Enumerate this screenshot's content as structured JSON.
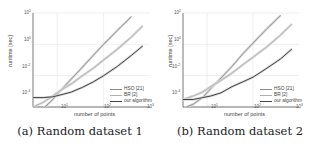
{
  "figure": {
    "panels": [
      {
        "caption": "(a) Random dataset 1",
        "xlabel": "number of points",
        "ylabel": "runtime [sec]",
        "xticks": [
          {
            "base": "10",
            "exp": "1"
          },
          {
            "base": "10",
            "exp": "2"
          },
          {
            "base": "10",
            "exp": "3"
          }
        ],
        "yticks": [
          {
            "base": "10",
            "exp": "2"
          },
          {
            "base": "10",
            "exp": "0"
          },
          {
            "base": "10",
            "exp": "-2"
          },
          {
            "base": "10",
            "exp": "-4"
          }
        ],
        "legend": [
          "HSO [21]",
          "BR [2]",
          "our algorithm"
        ]
      },
      {
        "caption": "(b) Random dataset 2",
        "xlabel": "number of points",
        "ylabel": "runtime [sec]",
        "xticks": [
          {
            "base": "10",
            "exp": "1"
          },
          {
            "base": "10",
            "exp": "2"
          },
          {
            "base": "10",
            "exp": "3"
          }
        ],
        "yticks": [
          {
            "base": "10",
            "exp": "2"
          },
          {
            "base": "10",
            "exp": "0"
          },
          {
            "base": "10",
            "exp": "-2"
          },
          {
            "base": "10",
            "exp": "-4"
          }
        ],
        "legend": [
          "HSO [21]",
          "BR [2]",
          "our algorithm"
        ]
      }
    ]
  },
  "chart_data": [
    {
      "type": "line",
      "title": "(a) Random dataset 1",
      "xlabel": "number of points",
      "ylabel": "runtime [sec]",
      "xscale": "log",
      "yscale": "log",
      "xlim": [
        3,
        1000
      ],
      "ylim": [
        0.0001,
        100
      ],
      "grid": true,
      "legend_position": "lower right",
      "x": [
        3,
        5,
        8,
        12,
        20,
        35,
        60,
        100,
        200,
        400,
        700
      ],
      "series": [
        {
          "name": "HSO [21]",
          "color": "#8a8a8a",
          "values": [
            3e-05,
            8e-05,
            0.0003,
            0.0012,
            0.006,
            0.035,
            0.2,
            1.0,
            8.0,
            60,
            null
          ]
        },
        {
          "name": "BR [2]",
          "color": "#b0b0b0",
          "values": [
            0.0001,
            0.0002,
            0.0005,
            0.0012,
            0.003,
            0.01,
            0.03,
            0.1,
            0.5,
            3.0,
            15.0
          ]
        },
        {
          "name": "our algorithm",
          "color": "#444444",
          "values": [
            0.0004,
            0.0004,
            0.00045,
            0.0006,
            0.0009,
            0.0018,
            0.004,
            0.01,
            0.04,
            0.2,
            0.8
          ]
        }
      ]
    },
    {
      "type": "line",
      "title": "(b) Random dataset 2",
      "xlabel": "number of points",
      "ylabel": "runtime [sec]",
      "xscale": "log",
      "yscale": "log",
      "xlim": [
        3,
        1000
      ],
      "ylim": [
        0.0001,
        100
      ],
      "grid": true,
      "legend_position": "lower right",
      "x": [
        3,
        5,
        8,
        12,
        20,
        35,
        60,
        100,
        200,
        400,
        700
      ],
      "series": [
        {
          "name": "HSO [21]",
          "color": "#8a8a8a",
          "values": [
            8e-05,
            0.00015,
            0.0004,
            0.0015,
            0.007,
            0.04,
            0.25,
            1.2,
            10.0,
            70,
            null
          ]
        },
        {
          "name": "BR [2]",
          "color": "#b0b0b0",
          "values": [
            0.0003,
            0.0005,
            0.0009,
            0.002,
            0.005,
            0.015,
            0.05,
            0.15,
            0.7,
            4.0,
            20.0
          ]
        },
        {
          "name": "our algorithm",
          "color": "#444444",
          "values": [
            0.0003,
            0.0003,
            0.0004,
            0.0005,
            0.0008,
            0.002,
            0.004,
            0.008,
            0.03,
            0.12,
            0.5
          ]
        }
      ]
    }
  ]
}
